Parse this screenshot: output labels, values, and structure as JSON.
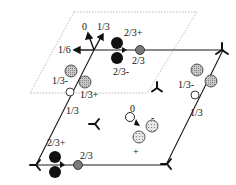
{
  "figure": {
    "type": "symmetry-diagram"
  },
  "colors": {
    "cell_line": "#1a1a1a",
    "dashed_cell": "#a0a0a0",
    "atom_black": "#111111",
    "atom_grey": "#7a7a7a",
    "atom_hatched": "#b8b8b8",
    "atom_dotted": "#d6d6d6"
  },
  "labels": {
    "top_arrow_0": "0",
    "top_arrow_1_3": "1/3",
    "top_arrow_1_6": "1/6",
    "top_pair_2_3plus": "2/3+",
    "top_grey_2_3": "2/3",
    "top_pair_2_3minus": "2/3-",
    "left_hatched_1_3minus": "1/3-",
    "left_hatched_1_3plus": "1/3+",
    "left_edge_1_3": "1/3",
    "right_hatched_1_3minus": "1/3-",
    "right_edge_1_3": "1/3",
    "center_0": "0",
    "center_minus": "-",
    "center_plus": "+",
    "bottom_pair_2_3plus": "2/3+",
    "bottom_grey_2_3": "2/3"
  }
}
